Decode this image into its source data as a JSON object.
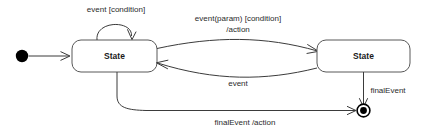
{
  "diagram": {
    "type": "uml-state-machine",
    "title": "",
    "background_color": "#ffffff",
    "line_color": "#3b3b3b",
    "text_color": "#2b2b2b",
    "nodes": [
      {
        "id": "initial",
        "kind": "initial-pseudostate",
        "label": ""
      },
      {
        "id": "state_left",
        "kind": "state",
        "label": "State"
      },
      {
        "id": "state_right",
        "kind": "state",
        "label": "State"
      },
      {
        "id": "final",
        "kind": "final-state",
        "label": ""
      }
    ],
    "transitions": [
      {
        "id": "start",
        "from": "initial",
        "to": "state_left",
        "label": ""
      },
      {
        "id": "self_loop",
        "from": "state_left",
        "to": "state_left",
        "label": "event [condition]"
      },
      {
        "id": "left_to_right",
        "from": "state_left",
        "to": "state_right",
        "label_line1": "event(param) [condition]",
        "label_line2": "/action"
      },
      {
        "id": "right_to_left",
        "from": "state_right",
        "to": "state_left",
        "label": "event"
      },
      {
        "id": "right_to_final",
        "from": "state_right",
        "to": "final",
        "label": "finalEvent"
      },
      {
        "id": "left_to_final",
        "from": "state_left",
        "to": "final",
        "label": "finalEvent /action"
      }
    ]
  }
}
